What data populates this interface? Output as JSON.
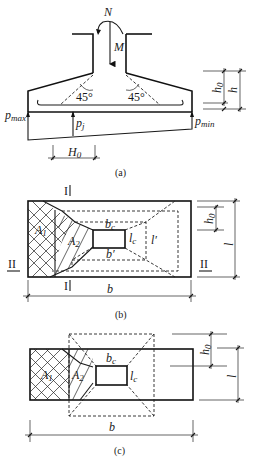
{
  "figure_a": {
    "caption": "(a)",
    "load_N": "N",
    "moment_M": "M",
    "angle_left": "45°",
    "angle_right": "45°",
    "p_max": "p",
    "p_max_sub": "max",
    "p_min": "p",
    "p_min_sub": "min",
    "p_j": "p",
    "p_j_sub": "j",
    "H0": "H",
    "H0_sub": "0",
    "h0": "h",
    "h0_sub": "0",
    "h": "h"
  },
  "figure_b": {
    "caption": "(b)",
    "section_I": "I",
    "section_II": "II",
    "A1": "A",
    "A1_sub": "1",
    "A2": "A",
    "A2_sub": "2",
    "bc": "b",
    "bc_sub": "c",
    "lc": "l",
    "lc_sub": "c",
    "b_prime": "b′",
    "l_prime": "l′",
    "b": "b",
    "l": "l",
    "h0": "h",
    "h0_sub": "0"
  },
  "figure_c": {
    "caption": "(c)",
    "A1": "A",
    "A1_sub": "1",
    "A2": "A",
    "A2_sub": "2",
    "bc": "b",
    "bc_sub": "c",
    "lc": "l",
    "lc_sub": "c",
    "b": "b",
    "l": "l",
    "h0": "h",
    "h0_sub": "0"
  }
}
